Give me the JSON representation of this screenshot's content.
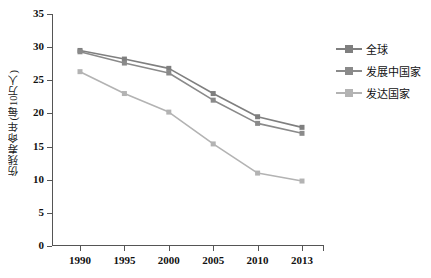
{
  "chart_data": {
    "type": "line",
    "title": "",
    "xlabel": "",
    "ylabel": "伤残寿命年(每10万人)",
    "categories": [
      "1990",
      "1995",
      "2000",
      "2005",
      "2010",
      "2013"
    ],
    "x_tick_labels": [
      "1990",
      "1995",
      "2000",
      "2005",
      "2010",
      "2013"
    ],
    "y_tick_labels": [
      "0",
      "5",
      "10",
      "15",
      "20",
      "25",
      "30",
      "35"
    ],
    "y_ticks": [
      0,
      5,
      10,
      15,
      20,
      25,
      30,
      35
    ],
    "ylim": [
      0,
      35
    ],
    "grid": false,
    "legend_position": "right",
    "series": [
      {
        "name": "全球",
        "color": "#7f7f7f",
        "marker": "square",
        "values": [
          29.5,
          28.2,
          26.8,
          23.0,
          19.5,
          17.9
        ]
      },
      {
        "name": "发展中国家",
        "color": "#8a8a8a",
        "marker": "square",
        "values": [
          29.3,
          27.6,
          26.1,
          22.0,
          18.5,
          17.0
        ]
      },
      {
        "name": "发达国家",
        "color": "#b3b3b3",
        "marker": "square",
        "values": [
          26.3,
          23.0,
          20.2,
          15.4,
          11.0,
          9.8
        ]
      }
    ]
  },
  "axis": {
    "y_title": "伤残寿命年(每10万人)"
  },
  "legend": {
    "items": [
      {
        "label": "全球",
        "color": "#7f7f7f"
      },
      {
        "label": "发展中国家",
        "color": "#8a8a8a"
      },
      {
        "label": "发达国家",
        "color": "#b3b3b3"
      }
    ]
  }
}
